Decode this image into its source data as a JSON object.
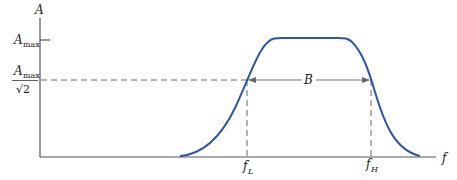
{
  "diagram": {
    "type": "bandpass-frequency-response",
    "axes": {
      "y_label": "A",
      "x_label": "f"
    },
    "y_ticks": [
      {
        "label": "A",
        "subscript": "max",
        "level": "Amax"
      },
      {
        "label": "A",
        "subscript": "max",
        "denominator": "√2",
        "level": "Amax/√2"
      }
    ],
    "x_markers": [
      {
        "label": "f",
        "subscript": "L"
      },
      {
        "label": "f",
        "subscript": "H"
      }
    ],
    "bandwidth_label": "B",
    "colors": {
      "curve": "#2f55a8",
      "axes": "#555555",
      "dashed": "#666666",
      "arrow": "#777777"
    }
  }
}
